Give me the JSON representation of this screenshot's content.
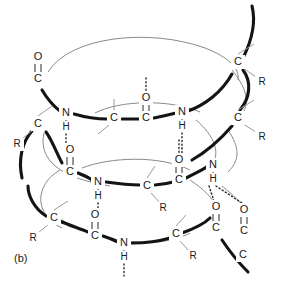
{
  "figure": {
    "panel_label": "(b)",
    "kind": "alpha-helix hydrogen bonding diagram",
    "colors": {
      "front_backbone": "#141414",
      "back_backbone": "#8a8a8a",
      "bond": "#2a2a2a",
      "side_chain": "#9a9a9a",
      "background": "#ffffff",
      "text": "#1a1a1a"
    }
  },
  "atoms": [
    {
      "id": "a1",
      "label": "O",
      "x": 38,
      "y": 57
    },
    {
      "id": "a2",
      "label": "C",
      "x": 38,
      "y": 79
    },
    {
      "id": "a3",
      "label": "N",
      "x": 66,
      "y": 113
    },
    {
      "id": "a4",
      "label": "H",
      "x": 66,
      "y": 127
    },
    {
      "id": "a5",
      "label": "C",
      "x": 114,
      "y": 118
    },
    {
      "id": "a6",
      "label": "O",
      "x": 146,
      "y": 98
    },
    {
      "id": "a7",
      "label": "C",
      "x": 146,
      "y": 118
    },
    {
      "id": "a8",
      "label": "N",
      "x": 182,
      "y": 112
    },
    {
      "id": "a9",
      "label": "H",
      "x": 182,
      "y": 126
    },
    {
      "id": "a10",
      "label": "C",
      "x": 238,
      "y": 62
    },
    {
      "id": "a11",
      "label": "R",
      "x": 262,
      "y": 82
    },
    {
      "id": "a12",
      "label": "C",
      "x": 238,
      "y": 118
    },
    {
      "id": "a13",
      "label": "R",
      "x": 262,
      "y": 137
    },
    {
      "id": "a14",
      "label": "C",
      "x": 38,
      "y": 124
    },
    {
      "id": "a15",
      "label": "R",
      "x": 17,
      "y": 144
    },
    {
      "id": "a16",
      "label": "O",
      "x": 70,
      "y": 150
    },
    {
      "id": "a17",
      "label": "C",
      "x": 70,
      "y": 172
    },
    {
      "id": "a18",
      "label": "N",
      "x": 98,
      "y": 182
    },
    {
      "id": "a19",
      "label": "H",
      "x": 98,
      "y": 196
    },
    {
      "id": "a20",
      "label": "C",
      "x": 147,
      "y": 186
    },
    {
      "id": "a21",
      "label": "R",
      "x": 163,
      "y": 208
    },
    {
      "id": "a22",
      "label": "O",
      "x": 179,
      "y": 160
    },
    {
      "id": "a23",
      "label": "C",
      "x": 179,
      "y": 180
    },
    {
      "id": "a24",
      "label": "N",
      "x": 213,
      "y": 165
    },
    {
      "id": "a25",
      "label": "H",
      "x": 213,
      "y": 179
    },
    {
      "id": "a26",
      "label": "C",
      "x": 54,
      "y": 218
    },
    {
      "id": "a27",
      "label": "R",
      "x": 33,
      "y": 238
    },
    {
      "id": "a28",
      "label": "O",
      "x": 95,
      "y": 215
    },
    {
      "id": "a29",
      "label": "C",
      "x": 95,
      "y": 236
    },
    {
      "id": "a30",
      "label": "N",
      "x": 124,
      "y": 243
    },
    {
      "id": "a31",
      "label": "H",
      "x": 124,
      "y": 257
    },
    {
      "id": "a32",
      "label": "C",
      "x": 176,
      "y": 234
    },
    {
      "id": "a33",
      "label": "R",
      "x": 193,
      "y": 256
    },
    {
      "id": "a34",
      "label": "O",
      "x": 216,
      "y": 207
    },
    {
      "id": "a35",
      "label": "C",
      "x": 216,
      "y": 228
    },
    {
      "id": "a36",
      "label": "O",
      "x": 244,
      "y": 210
    },
    {
      "id": "a37",
      "label": "C",
      "x": 244,
      "y": 231
    },
    {
      "id": "a38",
      "label": "C",
      "x": 243,
      "y": 255
    }
  ]
}
